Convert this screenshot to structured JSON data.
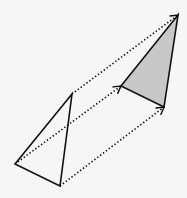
{
  "diagram": {
    "type": "geometric-translation",
    "background": "#f6f6f6",
    "stroke_color": "#111111",
    "original_triangle": {
      "fill": "none",
      "vertices": [
        {
          "name": "top",
          "x": 72,
          "y": 94
        },
        {
          "name": "left",
          "x": 15,
          "y": 164
        },
        {
          "name": "bottom",
          "x": 60,
          "y": 186
        }
      ]
    },
    "image_triangle": {
      "fill": "#c8c8c8",
      "vertices": [
        {
          "name": "top",
          "x": 178,
          "y": 15
        },
        {
          "name": "left",
          "x": 121,
          "y": 86
        },
        {
          "name": "bottom",
          "x": 164,
          "y": 107
        }
      ]
    },
    "translation_vectors": [
      {
        "from": {
          "x": 72,
          "y": 94
        },
        "to": {
          "x": 178,
          "y": 15
        },
        "style": "dotted",
        "arrowhead": "open-chevron"
      },
      {
        "from": {
          "x": 15,
          "y": 164
        },
        "to": {
          "x": 121,
          "y": 86
        },
        "style": "dotted",
        "arrowhead": "open-chevron"
      },
      {
        "from": {
          "x": 60,
          "y": 186
        },
        "to": {
          "x": 164,
          "y": 107
        },
        "style": "dotted",
        "arrowhead": "open-chevron"
      }
    ]
  }
}
